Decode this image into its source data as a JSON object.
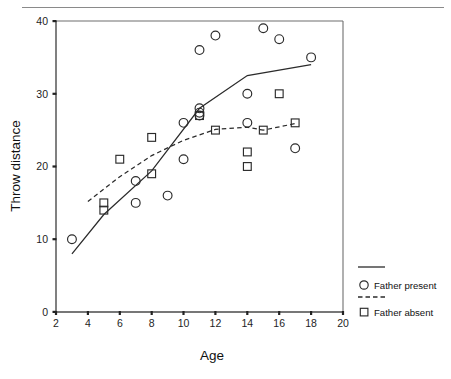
{
  "chart_data": {
    "type": "scatter",
    "title": "",
    "xlabel": "Age",
    "ylabel": "Throw distance",
    "xlim": [
      2,
      20
    ],
    "ylim": [
      0,
      40
    ],
    "xticks": [
      2,
      4,
      6,
      8,
      10,
      12,
      14,
      16,
      18,
      20
    ],
    "yticks": [
      0,
      10,
      20,
      30,
      40
    ],
    "xtick_labels": [
      "2",
      "4",
      "6",
      "8",
      "10",
      "12",
      "14",
      "16",
      "18",
      "20"
    ],
    "ytick_labels": [
      "0",
      "10",
      "20",
      "30",
      "40"
    ],
    "grid": false,
    "legend_position": "right-outside",
    "series": [
      {
        "name": "Father present",
        "marker": "circle-open",
        "line_style": "solid",
        "points": [
          {
            "x": 3,
            "y": 10
          },
          {
            "x": 7,
            "y": 18
          },
          {
            "x": 7,
            "y": 15
          },
          {
            "x": 9,
            "y": 16
          },
          {
            "x": 10,
            "y": 26
          },
          {
            "x": 10,
            "y": 21
          },
          {
            "x": 11,
            "y": 28
          },
          {
            "x": 11,
            "y": 27.4
          },
          {
            "x": 11,
            "y": 27
          },
          {
            "x": 11,
            "y": 36
          },
          {
            "x": 12,
            "y": 38
          },
          {
            "x": 14,
            "y": 30
          },
          {
            "x": 14,
            "y": 26
          },
          {
            "x": 15,
            "y": 39
          },
          {
            "x": 16,
            "y": 37.5
          },
          {
            "x": 17,
            "y": 22.5
          },
          {
            "x": 18,
            "y": 35
          }
        ],
        "trend_line": [
          {
            "x": 3,
            "y": 8
          },
          {
            "x": 5,
            "y": 13.4
          },
          {
            "x": 8,
            "y": 19.4
          },
          {
            "x": 11,
            "y": 28
          },
          {
            "x": 14,
            "y": 32.5
          },
          {
            "x": 18,
            "y": 34
          }
        ]
      },
      {
        "name": "Father absent",
        "marker": "square-open",
        "line_style": "dashed",
        "points": [
          {
            "x": 5,
            "y": 15
          },
          {
            "x": 5,
            "y": 14
          },
          {
            "x": 6,
            "y": 21
          },
          {
            "x": 8,
            "y": 24
          },
          {
            "x": 8,
            "y": 19
          },
          {
            "x": 11,
            "y": 27
          },
          {
            "x": 12,
            "y": 25
          },
          {
            "x": 14,
            "y": 22
          },
          {
            "x": 14,
            "y": 20
          },
          {
            "x": 15,
            "y": 25
          },
          {
            "x": 16,
            "y": 30
          },
          {
            "x": 17,
            "y": 26
          }
        ],
        "trend_line": [
          {
            "x": 4,
            "y": 15.2
          },
          {
            "x": 6,
            "y": 18.6
          },
          {
            "x": 8,
            "y": 21.5
          },
          {
            "x": 10,
            "y": 23.6
          },
          {
            "x": 12,
            "y": 25.1
          },
          {
            "x": 14,
            "y": 25.4
          },
          {
            "x": 15,
            "y": 25
          },
          {
            "x": 17,
            "y": 25.9
          }
        ]
      }
    ]
  },
  "legend": {
    "entries": [
      {
        "label": "Father present",
        "marker": "circle-open",
        "line_style": "solid"
      },
      {
        "label": "Father absent",
        "marker": "square-open",
        "line_style": "dashed"
      }
    ]
  }
}
